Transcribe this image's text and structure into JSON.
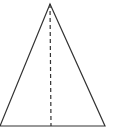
{
  "diagram": {
    "type": "geometry",
    "shape": "isosceles-triangle",
    "stroke_color": "#333333",
    "background": "#ffffff",
    "vertices": {
      "apex": [
        50,
        4
      ],
      "base_left": [
        0,
        126
      ],
      "base_right": [
        105,
        126
      ]
    },
    "altitude": {
      "from": [
        50,
        4
      ],
      "to": [
        51,
        126
      ],
      "style": "dashed"
    },
    "labels": []
  }
}
